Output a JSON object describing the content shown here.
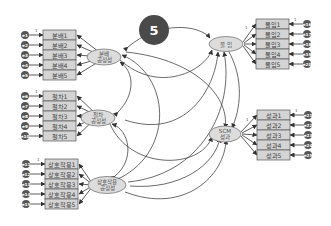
{
  "badge": {
    "label": "5",
    "color": "#4a4a4a"
  },
  "colors": {
    "box_fill": "#d4d4d4",
    "box_stroke": "#555555",
    "ellipse_fill": "#dcdcdc",
    "ellipse_stroke": "#666666",
    "error_fill": "#555555",
    "line": "#444444"
  },
  "latents": {
    "distributive": {
      "line1": "분배",
      "line2": "공정성"
    },
    "procedural": {
      "line1": "절차",
      "line2": "공정성"
    },
    "interactional": {
      "line1": "상호작용",
      "line2": "공정성"
    },
    "commitment": {
      "line1": "몰 입"
    },
    "performance": {
      "line1": "SCM",
      "line2": "성과"
    }
  },
  "indicators": {
    "distributive": [
      "분배1",
      "분배2",
      "분배3",
      "분배4",
      "분배5"
    ],
    "procedural": [
      "절차1",
      "절차2",
      "절차3",
      "절차4",
      "절차5"
    ],
    "interactional": [
      "상호작용1",
      "상호작용2",
      "상호작용3",
      "상호작용4",
      "상호작용5"
    ],
    "commitment": [
      "몰입1",
      "몰입2",
      "몰입3",
      "몰입4",
      "몰입5"
    ],
    "performance": [
      "성과1",
      "성과2",
      "성과3",
      "성과4",
      "성과5"
    ]
  },
  "errors": {
    "distributive": [
      "e1",
      "e2",
      "e3",
      "e4",
      "e5"
    ],
    "procedural": [
      "e6",
      "e7",
      "e8",
      "e9",
      "e10"
    ],
    "interactional": [
      "e11",
      "e12",
      "e13",
      "e14",
      "e15"
    ],
    "commitment": [
      "e16",
      "e17",
      "e18",
      "e19",
      "e20"
    ],
    "performance": [
      "e21",
      "e22",
      "e23",
      "e24",
      "e25"
    ]
  },
  "fixed_loading": "1"
}
